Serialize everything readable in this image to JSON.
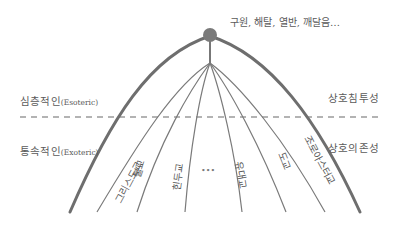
{
  "diagram": {
    "apex_label": "구원, 해탈, 열반, 깨달음…",
    "left_labels": {
      "upper_kr": "심층적인",
      "upper_en": "(Esoteric)",
      "lower_kr": "통속적인",
      "lower_en": "(Exoteric)"
    },
    "right_labels": {
      "upper": "상호침투성",
      "lower": "상호의존성"
    },
    "religions": [
      {
        "label": "그리스도교"
      },
      {
        "label": "불교"
      },
      {
        "label": "힌두교"
      },
      {
        "label": "•••"
      },
      {
        "label": "유대교"
      },
      {
        "label": "도교"
      },
      {
        "label": "조로아스터교"
      }
    ],
    "colors": {
      "arc": "#6e6e6e",
      "lines": "#7a7a7a",
      "apex_dot": "#777777",
      "dashed": "#999999",
      "text": "#555555"
    }
  }
}
